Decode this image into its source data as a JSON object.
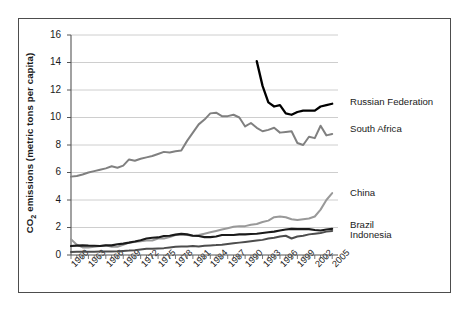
{
  "chart_data": {
    "type": "line",
    "title": "",
    "xlabel": "",
    "ylabel": "CO2 emissions (metric tons per capita)",
    "ylabel_parts": {
      "prefix": "CO",
      "sub": "2",
      "suffix": " emissions (metric  tons per capita)"
    },
    "xlim": [
      1960,
      2006
    ],
    "ylim": [
      0,
      16
    ],
    "yticks": [
      0,
      2,
      4,
      6,
      8,
      10,
      12,
      14,
      16
    ],
    "xticks": [
      1960,
      1963,
      1966,
      1969,
      1972,
      1975,
      1978,
      1981,
      1984,
      1987,
      1990,
      1993,
      1996,
      1999,
      2002,
      2005
    ],
    "xtick_labels": [
      "1960",
      "1963",
      "1966",
      "1969",
      "1972",
      "1975",
      "1978",
      "1981",
      "1984",
      "1987",
      "1990",
      "1993",
      "1996",
      "1999",
      "2002",
      "2005"
    ],
    "x_minor_tick_step": 1,
    "grid": "horizontal",
    "grid_color": "#c8c8c8",
    "legend_position": "right-inline-labels",
    "background": "#ffffff",
    "frame_color": "#4d4d4d",
    "series": [
      {
        "name": "Russian Federation",
        "color": "#000000",
        "width": 2.3,
        "label_x": 2007,
        "label_y": 11.1,
        "x": [
          1992,
          1993,
          1994,
          1995,
          1996,
          1997,
          1998,
          1999,
          2000,
          2001,
          2002,
          2003,
          2004,
          2005
        ],
        "values": [
          14.1,
          12.3,
          11.1,
          10.8,
          10.9,
          10.3,
          10.2,
          10.4,
          10.5,
          10.5,
          10.5,
          10.8,
          10.9,
          11.0
        ]
      },
      {
        "name": "South Africa",
        "color": "#808080",
        "width": 2.0,
        "label_x": 2007,
        "label_y": 9.2,
        "x": [
          1960,
          1961,
          1962,
          1963,
          1964,
          1965,
          1966,
          1967,
          1968,
          1969,
          1970,
          1971,
          1972,
          1973,
          1974,
          1975,
          1976,
          1977,
          1978,
          1979,
          1980,
          1981,
          1982,
          1983,
          1984,
          1985,
          1986,
          1987,
          1988,
          1989,
          1990,
          1991,
          1992,
          1993,
          1994,
          1995,
          1996,
          1997,
          1998,
          1999,
          2000,
          2001,
          2002,
          2003,
          2004,
          2005
        ],
        "values": [
          5.7,
          5.75,
          5.85,
          6.0,
          6.1,
          6.2,
          6.3,
          6.45,
          6.35,
          6.5,
          6.95,
          6.85,
          7.0,
          7.1,
          7.2,
          7.35,
          7.5,
          7.45,
          7.55,
          7.6,
          8.3,
          8.9,
          9.5,
          9.85,
          10.3,
          10.35,
          10.1,
          10.1,
          10.2,
          10.0,
          9.35,
          9.6,
          9.25,
          9.0,
          9.1,
          9.25,
          8.9,
          8.95,
          9.0,
          8.15,
          8.0,
          8.6,
          8.5,
          9.4,
          8.7,
          8.8
        ]
      },
      {
        "name": "China",
        "color": "#999999",
        "width": 2.0,
        "label_x": 2007,
        "label_y": 4.5,
        "x": [
          1960,
          1961,
          1962,
          1963,
          1964,
          1965,
          1966,
          1967,
          1968,
          1969,
          1970,
          1971,
          1972,
          1973,
          1974,
          1975,
          1976,
          1977,
          1978,
          1979,
          1980,
          1981,
          1982,
          1983,
          1984,
          1985,
          1986,
          1987,
          1988,
          1989,
          1990,
          1991,
          1992,
          1993,
          1994,
          1995,
          1996,
          1997,
          1998,
          1999,
          2000,
          2001,
          2002,
          2003,
          2004,
          2005
        ],
        "values": [
          1.15,
          0.75,
          0.55,
          0.55,
          0.6,
          0.65,
          0.7,
          0.6,
          0.6,
          0.75,
          0.9,
          0.95,
          1.0,
          1.05,
          1.05,
          1.2,
          1.2,
          1.3,
          1.45,
          1.45,
          1.45,
          1.4,
          1.45,
          1.55,
          1.65,
          1.75,
          1.85,
          1.95,
          2.05,
          2.1,
          2.1,
          2.2,
          2.25,
          2.4,
          2.5,
          2.75,
          2.8,
          2.75,
          2.6,
          2.55,
          2.6,
          2.65,
          2.8,
          3.3,
          4.0,
          4.5
        ]
      },
      {
        "name": "Brazil",
        "color": "#1a1a1a",
        "width": 2.1,
        "label_x": 2007,
        "label_y": 2.15,
        "x": [
          1960,
          1961,
          1962,
          1963,
          1964,
          1965,
          1966,
          1967,
          1968,
          1969,
          1970,
          1971,
          1972,
          1973,
          1974,
          1975,
          1976,
          1977,
          1978,
          1979,
          1980,
          1981,
          1982,
          1983,
          1984,
          1985,
          1986,
          1987,
          1988,
          1989,
          1990,
          1991,
          1992,
          1993,
          1994,
          1995,
          1996,
          1997,
          1998,
          1999,
          2000,
          2001,
          2002,
          2003,
          2004,
          2005
        ],
        "values": [
          0.65,
          0.68,
          0.7,
          0.68,
          0.67,
          0.65,
          0.7,
          0.7,
          0.78,
          0.83,
          0.9,
          0.98,
          1.08,
          1.2,
          1.25,
          1.28,
          1.38,
          1.4,
          1.48,
          1.55,
          1.5,
          1.4,
          1.38,
          1.3,
          1.3,
          1.35,
          1.45,
          1.45,
          1.45,
          1.5,
          1.5,
          1.53,
          1.55,
          1.6,
          1.65,
          1.7,
          1.78,
          1.85,
          1.9,
          1.88,
          1.88,
          1.88,
          1.82,
          1.78,
          1.85,
          1.9
        ]
      },
      {
        "name": "Indonesia",
        "color": "#4d4d4d",
        "width": 2.0,
        "label_x": 2007,
        "label_y": 1.45,
        "x": [
          1960,
          1961,
          1962,
          1963,
          1964,
          1965,
          1966,
          1967,
          1968,
          1969,
          1970,
          1971,
          1972,
          1973,
          1974,
          1975,
          1976,
          1977,
          1978,
          1979,
          1980,
          1981,
          1982,
          1983,
          1984,
          1985,
          1986,
          1987,
          1988,
          1989,
          1990,
          1991,
          1992,
          1993,
          1994,
          1995,
          1996,
          1997,
          1998,
          1999,
          2000,
          2001,
          2002,
          2003,
          2004,
          2005
        ],
        "values": [
          0.22,
          0.23,
          0.24,
          0.23,
          0.24,
          0.25,
          0.25,
          0.26,
          0.27,
          0.3,
          0.32,
          0.35,
          0.4,
          0.45,
          0.45,
          0.48,
          0.5,
          0.55,
          0.6,
          0.62,
          0.62,
          0.65,
          0.62,
          0.68,
          0.7,
          0.72,
          0.75,
          0.8,
          0.85,
          0.9,
          0.95,
          1.0,
          1.05,
          1.1,
          1.2,
          1.25,
          1.35,
          1.4,
          1.2,
          1.35,
          1.4,
          1.5,
          1.55,
          1.6,
          1.7,
          1.75
        ]
      }
    ]
  }
}
